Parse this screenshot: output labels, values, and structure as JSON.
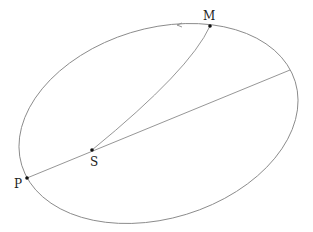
{
  "diagram": {
    "type": "orbit-ellipse",
    "colors": {
      "curve": "#8a8a8a",
      "point": "#111111",
      "label": "#222222"
    },
    "points": [
      {
        "id": "M",
        "label": "M",
        "x": 210,
        "y": 26
      },
      {
        "id": "S",
        "label": "S",
        "x": 92,
        "y": 150
      },
      {
        "id": "P",
        "label": "P",
        "x": 27,
        "y": 178
      }
    ],
    "segments": [
      {
        "from": "M",
        "to": "S"
      },
      {
        "from": "P",
        "to": "far-end",
        "through": "S"
      }
    ],
    "direction_arrow": "leftward-along-top"
  }
}
